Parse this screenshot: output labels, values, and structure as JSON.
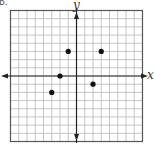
{
  "corner_label": "b.",
  "chart_data": {
    "type": "scatter",
    "title": "",
    "xlabel": "x",
    "ylabel": "y",
    "xlim": [
      -8,
      8
    ],
    "ylim": [
      -8,
      8
    ],
    "grid": true,
    "tick_labels": false,
    "legend": null,
    "points": [
      {
        "x": -1,
        "y": 3
      },
      {
        "x": 3,
        "y": 3
      },
      {
        "x": -2,
        "y": 0
      },
      {
        "x": 2,
        "y": -1
      },
      {
        "x": -3,
        "y": -2
      }
    ]
  },
  "style": {
    "grid_color": "#b8b8b8",
    "axis_color": "#222222",
    "border_color": "#555555",
    "point_color": "#111111"
  }
}
